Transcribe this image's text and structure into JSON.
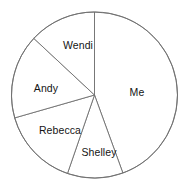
{
  "chart_data": {
    "type": "pie",
    "title": "",
    "subtitle": "",
    "xlabel": "",
    "ylabel": "",
    "legend_position": "none",
    "grid": false,
    "labels_inside": true,
    "start_angle_deg": 0,
    "direction": "clockwise",
    "center": {
      "x": 94.5,
      "y": 95
    },
    "radius": 83,
    "categories": [
      "Me",
      "Shelley",
      "Rebecca",
      "Andy",
      "Wendi"
    ],
    "values": [
      160,
      39,
      55,
      59,
      47
    ],
    "value_unit": "degrees",
    "slices": [
      {
        "label": "Me",
        "angle_deg": 160,
        "start_deg": 0,
        "end_deg": 160,
        "percent": 44.4,
        "color": "#ffffff",
        "label_x": 137,
        "label_y": 92
      },
      {
        "label": "Shelley",
        "angle_deg": 39,
        "start_deg": 160,
        "end_deg": 199,
        "percent": 10.8,
        "color": "#ffffff",
        "label_x": 99,
        "label_y": 152
      },
      {
        "label": "Rebecca",
        "angle_deg": 55,
        "start_deg": 199,
        "end_deg": 254,
        "percent": 15.3,
        "color": "#ffffff",
        "label_x": 60,
        "label_y": 130
      },
      {
        "label": "Andy",
        "angle_deg": 59,
        "start_deg": 254,
        "end_deg": 313,
        "percent": 16.4,
        "color": "#ffffff",
        "label_x": 46,
        "label_y": 88
      },
      {
        "label": "Wendi",
        "angle_deg": 47,
        "start_deg": 313,
        "end_deg": 360,
        "percent": 13.1,
        "color": "#ffffff",
        "label_x": 78,
        "label_y": 45
      }
    ],
    "stroke_color": "#6e6e6e",
    "background_color": "#ffffff"
  },
  "corner": {
    "mark": ""
  }
}
